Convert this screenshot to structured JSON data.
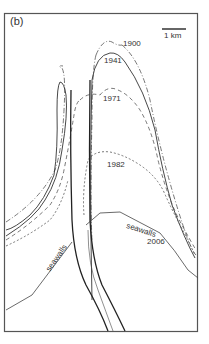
{
  "panel": {
    "label": "(b)"
  },
  "scale_bar": {
    "label": "1 km"
  },
  "shorelines": [
    {
      "year": "1900",
      "style": "dash-dot"
    },
    {
      "year": "1941",
      "style": "solid"
    },
    {
      "year": "1971",
      "style": "dashed"
    },
    {
      "year": "1982",
      "style": "dotted"
    },
    {
      "year": "2006",
      "style": "solid-thin"
    }
  ],
  "annotations": {
    "seawalls_left": "seawalls",
    "seawalls_right": "seawalls"
  },
  "colors": {
    "line": "#333333",
    "frame": "#555555",
    "background": "#ffffff"
  }
}
